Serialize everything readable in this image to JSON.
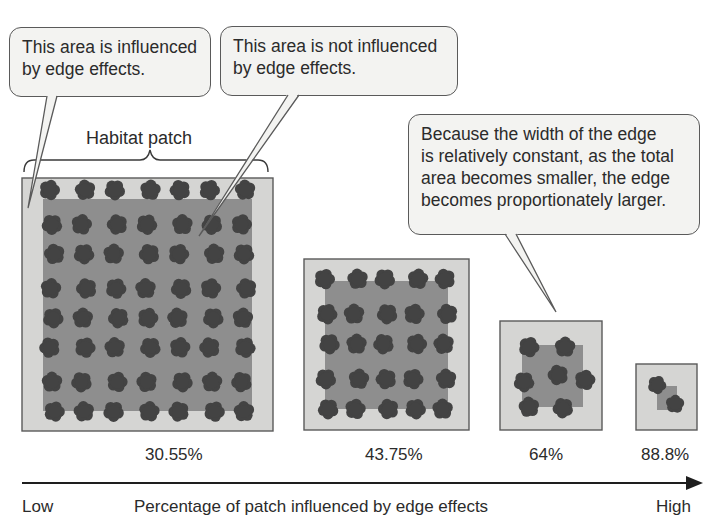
{
  "callouts": [
    {
      "id": "influenced",
      "lines": [
        "This area is influenced",
        "by edge effects."
      ],
      "box": [
        9,
        27,
        202,
        70
      ],
      "tail": [
        [
          47,
          96
        ],
        [
          57,
          96
        ],
        [
          28,
          208
        ]
      ]
    },
    {
      "id": "not-influenced",
      "lines": [
        "This area is not influenced",
        "by edge effects."
      ],
      "box": [
        220,
        26,
        238,
        70
      ],
      "tail": [
        [
          288,
          95
        ],
        [
          299,
          95
        ],
        [
          199,
          236
        ]
      ]
    },
    {
      "id": "proportion",
      "lines": [
        "Because the width of the edge",
        "is relatively constant, as the total",
        "area becomes smaller, the edge",
        "becomes proportionately larger."
      ],
      "box": [
        408,
        114,
        292,
        121
      ],
      "tail": [
        [
          505,
          234
        ],
        [
          516,
          234
        ],
        [
          556,
          312
        ]
      ]
    }
  ],
  "habitat_label": "Habitat patch",
  "patches": [
    {
      "name": "large",
      "outer": [
        22,
        178,
        251,
        253
      ],
      "inner": [
        43,
        199,
        209,
        212
      ],
      "percent": "30.55%",
      "percent_x": 145,
      "trees": {
        "cols": 7,
        "rows": 8,
        "x0": 52,
        "y0": 192,
        "dx": 32,
        "dy": 31.5,
        "r": 9.5
      }
    },
    {
      "name": "medium",
      "outer": [
        304,
        259,
        165,
        171
      ],
      "inner": [
        325,
        281,
        123,
        128
      ],
      "percent": "43.75%",
      "percent_x": 365,
      "trees": {
        "cols": 5,
        "rows": 5,
        "x0": 327,
        "y0": 281,
        "dx": 29.5,
        "dy": 32,
        "r": 9.5
      }
    },
    {
      "name": "small",
      "outer": [
        500,
        321,
        102,
        109
      ],
      "inner": [
        522,
        345,
        61,
        62
      ],
      "percent": "64%",
      "percent_x": 529,
      "trees": {
        "points": [
          [
            529,
            347
          ],
          [
            565,
            347
          ],
          [
            558,
            375
          ],
          [
            524,
            382
          ],
          [
            585,
            380
          ],
          [
            529,
            407
          ],
          [
            563,
            408
          ]
        ],
        "r": 9.5
      }
    },
    {
      "name": "tiny",
      "outer": [
        636,
        364,
        61,
        66
      ],
      "inner": [
        657,
        386,
        20,
        24
      ],
      "percent": "88.8%",
      "percent_x": 641,
      "trees": {
        "points": [
          [
            657,
            385
          ],
          [
            675,
            404
          ]
        ],
        "r": 8.5
      }
    }
  ],
  "axis": {
    "low_label": "Low",
    "high_label": "High",
    "title": "Percentage of patch influenced by edge effects"
  },
  "colors": {
    "edge_zone": "#d5d5d3",
    "core_zone": "#8e8e8e",
    "tree": "#434343",
    "border": "#5a5a5a",
    "text": "#2b2b2b"
  },
  "chart_data": {
    "type": "bar",
    "title": "Percentage of patch influenced by edge effects",
    "categories": [
      "Large patch",
      "Medium patch",
      "Small patch",
      "Tiny patch"
    ],
    "values": [
      30.55,
      43.75,
      64,
      88.8
    ],
    "xlabel": "Percentage of patch influenced by edge effects (Low → High)",
    "ylabel": ""
  }
}
